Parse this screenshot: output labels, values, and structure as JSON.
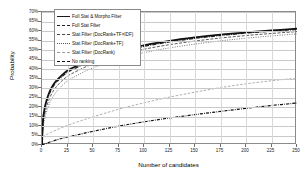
{
  "chart_data": {
    "type": "line",
    "title": "",
    "xlabel": "Number of candidates",
    "ylabel": "Probability",
    "xlim": [
      0,
      250
    ],
    "ylim": [
      0,
      0.7
    ],
    "grid": true,
    "legend_position": "top-left",
    "x_ticks": [
      "0",
      "25",
      "50",
      "75",
      "100",
      "125",
      "150",
      "175",
      "200",
      "225",
      "250"
    ],
    "y_ticks": [
      "0%",
      "5%",
      "10%",
      "15%",
      "20%",
      "25%",
      "30%",
      "35%",
      "40%",
      "45%",
      "50%",
      "55%",
      "60%",
      "65%",
      "70%"
    ],
    "x": [
      0,
      1,
      2,
      3,
      5,
      8,
      12,
      17,
      25,
      35,
      50,
      75,
      100,
      125,
      150,
      175,
      200,
      225,
      250
    ],
    "series": [
      {
        "name": "Full Stat & Morpho Filter",
        "style": "solid-thick",
        "values": [
          0.0,
          0.135,
          0.175,
          0.205,
          0.245,
          0.288,
          0.325,
          0.355,
          0.392,
          0.418,
          0.452,
          0.495,
          0.525,
          0.548,
          0.566,
          0.581,
          0.593,
          0.603,
          0.612
        ]
      },
      {
        "name": "Full Stat Filter",
        "style": "dashdot",
        "values": [
          0.0,
          0.128,
          0.168,
          0.197,
          0.236,
          0.279,
          0.316,
          0.346,
          0.383,
          0.41,
          0.444,
          0.488,
          0.519,
          0.542,
          0.561,
          0.576,
          0.589,
          0.599,
          0.608
        ]
      },
      {
        "name": "Stat Filter (DocRank+TF×IDF)",
        "style": "dash-fine",
        "values": [
          0.0,
          0.105,
          0.142,
          0.17,
          0.21,
          0.254,
          0.292,
          0.324,
          0.362,
          0.391,
          0.427,
          0.472,
          0.504,
          0.528,
          0.547,
          0.563,
          0.576,
          0.587,
          0.597
        ]
      },
      {
        "name": "Stat Filter (DocRank+TF)",
        "style": "dot",
        "values": [
          0.0,
          0.088,
          0.12,
          0.146,
          0.184,
          0.227,
          0.265,
          0.298,
          0.338,
          0.368,
          0.406,
          0.452,
          0.486,
          0.511,
          0.531,
          0.548,
          0.562,
          0.574,
          0.585
        ]
      },
      {
        "name": "Stat Filter (DocRank)",
        "style": "dash-light",
        "values": [
          0.0,
          0.042,
          0.046,
          0.05,
          0.056,
          0.064,
          0.074,
          0.086,
          0.103,
          0.122,
          0.148,
          0.188,
          0.222,
          0.252,
          0.278,
          0.302,
          0.322,
          0.338,
          0.352
        ]
      },
      {
        "name": "No ranking",
        "style": "dashdot-bold",
        "values": [
          0.0,
          0.002,
          0.004,
          0.006,
          0.01,
          0.016,
          0.023,
          0.031,
          0.042,
          0.054,
          0.072,
          0.099,
          0.122,
          0.142,
          0.16,
          0.177,
          0.193,
          0.208,
          0.221
        ]
      }
    ]
  },
  "axes": {
    "x_title": "Number of candidates",
    "y_title": "Probability"
  },
  "legend": {
    "items": [
      {
        "label": "Full Stat & Morpho Filter",
        "style": "solid-thick"
      },
      {
        "label": "Full Stat Filter",
        "style": "dashdot"
      },
      {
        "label": "Stat Filter (DocRank+TF×IDF)",
        "style": "dash-fine"
      },
      {
        "label": "Stat Filter (DocRank+TF)",
        "style": "dot"
      },
      {
        "label": "Stat Filter (DocRank)",
        "style": "dash-light"
      },
      {
        "label": "No ranking",
        "style": "dashdot-bold"
      }
    ]
  },
  "colors": {
    "axis": "#8a8a8a",
    "grid": "#c9c9c9",
    "line_dark": "#1a1a1a",
    "line_mid": "#5a5a5a",
    "line_light": "#9a9a9a",
    "background": "#ffffff"
  }
}
